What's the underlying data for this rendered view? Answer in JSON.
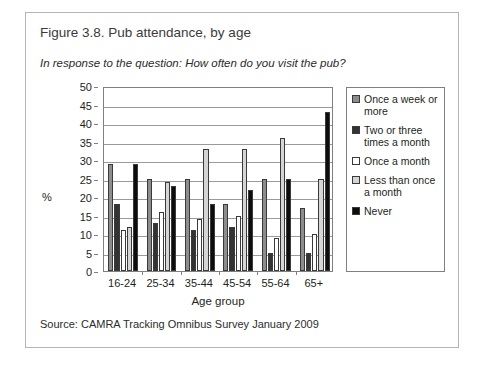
{
  "figure": {
    "title": "Figure 3.8. Pub attendance, by age",
    "subtitle": "In response to the question: How often do you visit the pub?",
    "source": "Source: CAMRA Tracking Omnibus Survey January 2009"
  },
  "colors": {
    "once_a_week_or_more": "#8d8d8d",
    "two_or_three_times_a_month": "#333333",
    "once_a_month": "#ffffff",
    "less_than_once_a_month": "#d5d5d5",
    "never": "#0d0d0d",
    "axis": "#808080",
    "gridline": "#9a9a9a",
    "border": "#b5b5b5"
  },
  "chart_data": {
    "type": "bar",
    "title": "Figure 3.8. Pub attendance, by age",
    "subtitle": "In response to the question: How often do you visit the pub?",
    "xlabel": "Age group",
    "ylabel": "%",
    "ylim": [
      0,
      50
    ],
    "yticks": [
      0,
      5,
      10,
      15,
      20,
      25,
      30,
      35,
      40,
      45,
      50
    ],
    "grid": true,
    "legend_position": "right",
    "categories": [
      "16-24",
      "25-34",
      "35-44",
      "45-54",
      "55-64",
      "65+"
    ],
    "series": [
      {
        "name": "Once a week or more",
        "values": [
          29,
          25,
          25,
          18,
          25,
          17
        ]
      },
      {
        "name": "Two or three times a month",
        "values": [
          18,
          13,
          11,
          12,
          5,
          5
        ]
      },
      {
        "name": "Once a month",
        "values": [
          11,
          16,
          14,
          15,
          9,
          10
        ]
      },
      {
        "name": "Less than once a month",
        "values": [
          12,
          24,
          33,
          33,
          36,
          25
        ]
      },
      {
        "name": "Never",
        "values": [
          29,
          23,
          18,
          22,
          25,
          43
        ]
      }
    ]
  },
  "legend": {
    "items": [
      {
        "label": "Once a week or more"
      },
      {
        "label": "Two or three times a month"
      },
      {
        "label": "Once a month"
      },
      {
        "label": "Less than once a month"
      },
      {
        "label": "Never"
      }
    ]
  }
}
